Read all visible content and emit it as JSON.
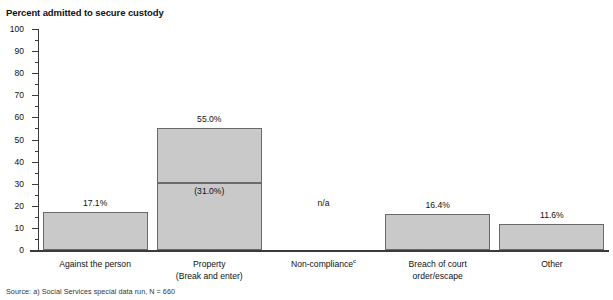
{
  "clipped_title": "convictions",
  "y_axis_title": "Percent admitted to secure custody",
  "source_note": "Source: a) Social Services special data run, N = 660",
  "chart_data": {
    "type": "bar",
    "title": "Percent admitted to secure custody",
    "xlabel": "",
    "ylabel": "Percent admitted to secure custody",
    "ylim": [
      0,
      100
    ],
    "ytick_step": 10,
    "yminor_step": 5,
    "grid": false,
    "legend": null,
    "categories": [
      "Against the person",
      "Property (Break and enter)",
      "Non-compliance",
      "Breach of court order/escape",
      "Other"
    ],
    "category_lines": [
      [
        "Against the person"
      ],
      [
        "Property",
        "(Break and enter)"
      ],
      [
        "Non-compliance"
      ],
      [
        "Breach of court",
        "order/escape"
      ],
      [
        "Other"
      ]
    ],
    "values": [
      17.1,
      55.0,
      null,
      16.4,
      11.6
    ],
    "value_labels": [
      "17.1%",
      "55.0%",
      "n/a",
      "16.4%",
      "11.6%"
    ],
    "sub_segment": {
      "category": "Property (Break and enter)",
      "value": 31.0,
      "label": "(31.0%)"
    },
    "annotations": [
      "n/a"
    ],
    "footnote_marker": "c",
    "sample_size": "N = 660"
  },
  "ticks": [
    {
      "label": "100",
      "value": 100
    },
    {
      "label": "90",
      "value": 90
    },
    {
      "label": "80",
      "value": 80
    },
    {
      "label": "70",
      "value": 70
    },
    {
      "label": "60",
      "value": 60
    },
    {
      "label": "50",
      "value": 50
    },
    {
      "label": "40",
      "value": 40
    },
    {
      "label": "30",
      "value": 30
    },
    {
      "label": "20",
      "value": 20
    },
    {
      "label": "10",
      "value": 10
    },
    {
      "label": "0",
      "value": 0
    }
  ],
  "colors": {
    "bar_fill": "#c9c9c9",
    "bar_stroke": "#6a6a6a",
    "axis": "#3a3a3a",
    "text": "#111111"
  }
}
